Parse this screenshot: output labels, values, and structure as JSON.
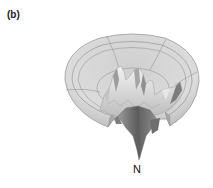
{
  "figure": {
    "panel_label": "(b)",
    "pole_label": "N",
    "colors": {
      "dish_fill": "#d9d9d9",
      "dish_rim": "#c8c8c8",
      "grid_line": "#8a8a8a",
      "relief_light": "#ececec",
      "relief_mid": "#b5b5b5",
      "relief_dark": "#6e6e6e",
      "spike": "#7a7a7a",
      "text": "#111111"
    }
  }
}
